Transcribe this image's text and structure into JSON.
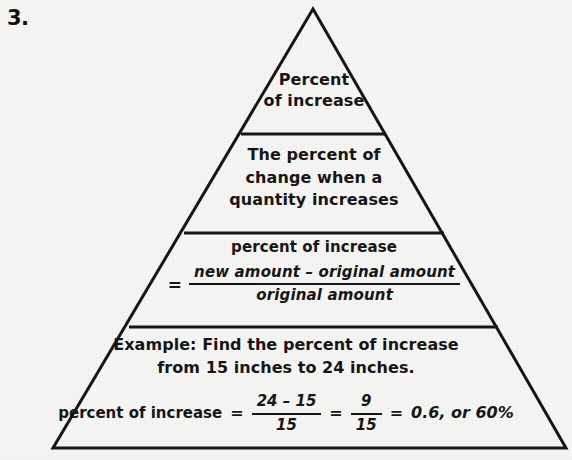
{
  "item": {
    "number": "3."
  },
  "colors": {
    "ink": "#161616",
    "page_background": "#f5f5f4"
  },
  "pyramid": {
    "shape": "triangle",
    "tiers": [
      {
        "id": "tier-1-term",
        "lines": [
          "Percent",
          "of increase"
        ]
      },
      {
        "id": "tier-2-definition",
        "lines": [
          "The percent of",
          "change when a",
          "quantity increases"
        ]
      },
      {
        "id": "tier-3-formula",
        "label": "percent of increase",
        "equals": "=",
        "numerator": "new amount – original amount",
        "denominator": "original amount"
      },
      {
        "id": "tier-4-example",
        "example_lines": [
          "Example: Find the percent of increase",
          "from 15 inches to 24 inches."
        ],
        "solution": {
          "lead": "percent of increase",
          "equals_1": "=",
          "frac1_numerator": "24 – 15",
          "frac1_denominator": "15",
          "equals_2": "=",
          "frac2_numerator": "9",
          "frac2_denominator": "15",
          "equals_3": "=",
          "result": "0.6, or 60%"
        }
      }
    ]
  }
}
